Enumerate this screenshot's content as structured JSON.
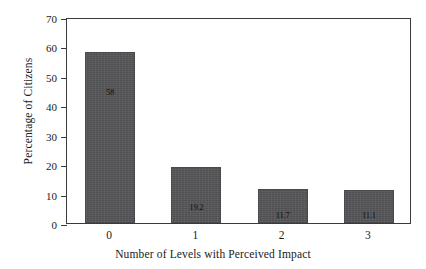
{
  "chart_data": {
    "type": "bar",
    "title": "",
    "subtitle": "",
    "xlabel": "Number of Levels with Perceived Impact",
    "ylabel": "Percentage of Citizens",
    "categories": [
      "0",
      "1",
      "2",
      "3"
    ],
    "values": [
      58.0,
      19.2,
      11.7,
      11.1
    ],
    "bar_labels": [
      "58",
      "19.2",
      "11.7",
      "11.1"
    ],
    "ylim": [
      0,
      70
    ],
    "yticks": [
      0,
      10,
      20,
      30,
      40,
      50,
      60,
      70
    ],
    "ytick_labels": [
      "0",
      "10",
      "20",
      "30",
      "40",
      "50",
      "60",
      "70"
    ],
    "xtick_labels": [
      "0",
      "1",
      "2",
      "3"
    ],
    "grid": false,
    "legend": false,
    "legend_position": "none",
    "bar_color": "#56565a",
    "bar_edge_color": "#4a4a4e",
    "axis_color": "#3a3a3a",
    "background_color": "#ffffff",
    "text_color": "#1a1a1a",
    "value_label_position": "inside"
  }
}
